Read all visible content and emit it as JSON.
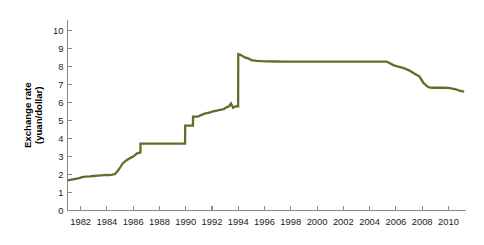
{
  "chart_data": {
    "type": "line",
    "title": "",
    "subtitle": "",
    "xlabel": "",
    "ylabel": "Exchange rate (yuan/dollar)",
    "ylabel_line1": "Exchange rate",
    "ylabel_line2": "(yuan/dollar)",
    "grid": false,
    "legend": "none",
    "xlim": [
      1981.0,
      2011.3
    ],
    "ylim": [
      0,
      10.6
    ],
    "xticks": [
      1982,
      1984,
      1986,
      1988,
      1990,
      1992,
      1994,
      1996,
      1998,
      2000,
      2002,
      2004,
      2006,
      2008,
      2010
    ],
    "xtick_labels": [
      "1982",
      "1984",
      "1986",
      "1988",
      "1990",
      "1992",
      "1994",
      "1996",
      "1998",
      "2000",
      "2002",
      "2004",
      "2006",
      "2008",
      "2010"
    ],
    "yticks": [
      0,
      1,
      2,
      3,
      4,
      5,
      6,
      7,
      8,
      9,
      10
    ],
    "ytick_labels": [
      "0",
      "1",
      "2",
      "3",
      "4",
      "5",
      "6",
      "7",
      "8",
      "9",
      "10"
    ],
    "series": [
      {
        "name": "Yuan per US dollar",
        "color": "#5f6f2a",
        "x": [
          1981.0,
          1981.3,
          1981.6,
          1981.9,
          1982.1,
          1982.4,
          1982.7,
          1983.0,
          1983.3,
          1983.6,
          1983.9,
          1984.2,
          1984.4,
          1984.6,
          1984.8,
          1985.0,
          1985.2,
          1985.5,
          1985.8,
          1986.0,
          1986.3,
          1986.55,
          1986.56,
          1989.95,
          1989.96,
          1990.55,
          1990.56,
          1990.9,
          1991.2,
          1991.5,
          1991.8,
          1992.0,
          1992.3,
          1992.6,
          1992.9,
          1993.0,
          1993.15,
          1993.3,
          1993.45,
          1993.6,
          1993.75,
          1993.9,
          1993.99,
          1994.0,
          1994.2,
          1994.5,
          1994.8,
          1995.0,
          1995.4,
          1995.8,
          1996.2,
          1996.8,
          1997.5,
          1998.5,
          2000.0,
          2002.0,
          2004.0,
          2005.3,
          2005.55,
          2005.8,
          2006.2,
          2006.6,
          2007.0,
          2007.4,
          2007.8,
          2008.1,
          2008.4,
          2008.6,
          2009.0,
          2009.5,
          2010.0,
          2010.5,
          2010.9,
          2011.2
        ],
        "y": [
          1.68,
          1.72,
          1.76,
          1.8,
          1.86,
          1.89,
          1.9,
          1.92,
          1.94,
          1.96,
          1.98,
          1.97,
          1.99,
          2.02,
          2.18,
          2.38,
          2.62,
          2.8,
          2.93,
          3.0,
          3.18,
          3.22,
          3.72,
          3.72,
          4.72,
          4.72,
          5.22,
          5.22,
          5.32,
          5.4,
          5.44,
          5.5,
          5.55,
          5.6,
          5.64,
          5.7,
          5.75,
          5.8,
          5.95,
          5.72,
          5.78,
          5.8,
          5.8,
          8.7,
          8.65,
          8.52,
          8.45,
          8.37,
          8.33,
          8.31,
          8.3,
          8.29,
          8.28,
          8.28,
          8.28,
          8.28,
          8.28,
          8.28,
          8.19,
          8.09,
          8.0,
          7.92,
          7.8,
          7.62,
          7.45,
          7.1,
          6.9,
          6.84,
          6.83,
          6.83,
          6.82,
          6.76,
          6.66,
          6.62
        ]
      }
    ],
    "annotations": [],
    "notes": {
      "axis_color": "#8a8a8a",
      "line_color": "#5f6f2a",
      "background": "#ffffff"
    }
  }
}
